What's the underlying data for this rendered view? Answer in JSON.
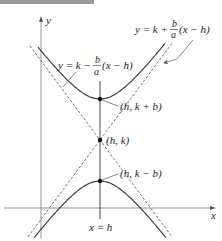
{
  "diagram": {
    "title": "",
    "axes": {
      "x_label": "x",
      "y_label": "y"
    },
    "curve": "vertical hyperbola (y-k)^2/b^2 - (x-h)^2/a^2 = 1",
    "asymptotes": {
      "upper_right": {
        "lhs": "y = k +",
        "frac_num": "b",
        "frac_den": "a",
        "rhs": "(x − h)"
      },
      "upper_left": {
        "lhs": "y = k −",
        "frac_num": "b",
        "frac_den": "a",
        "rhs": "(x − h)"
      }
    },
    "points": [
      {
        "label": "(h, k + b)",
        "role": "upper-vertex"
      },
      {
        "label": "(h, k)",
        "role": "center"
      },
      {
        "label": "(h, k − b)",
        "role": "lower-vertex"
      }
    ],
    "axis_of_symmetry_label": "x = h",
    "colors": {
      "curve": "#333333",
      "asymptote": "#555555",
      "axis": "#777777",
      "text": "#222222"
    }
  }
}
